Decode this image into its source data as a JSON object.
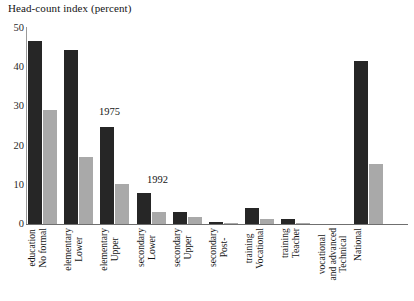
{
  "chart_data": {
    "type": "bar",
    "title": "Head-count index (percent)",
    "xlabel": "",
    "ylabel": "Head-count index (percent)",
    "ylim": [
      0,
      50
    ],
    "yticks": [
      0,
      10,
      20,
      30,
      40,
      50
    ],
    "grid": false,
    "legend_position": "inline-annotation",
    "annotations": [
      {
        "text": "1975",
        "series": "1975",
        "category": "Upper elementary"
      },
      {
        "text": "1992",
        "series": "1992",
        "category": "Upper elementary"
      }
    ],
    "categories": [
      "No formal education",
      "Lower elementary",
      "Upper elementary",
      "Lower secondary",
      "Upper secondary",
      "Post-secondary",
      "Vocational training",
      "Teacher training",
      "Technical and advanced vocational",
      "National"
    ],
    "category_lines": [
      [
        "No formal",
        "education"
      ],
      [
        "Lower",
        "elementary"
      ],
      [
        "Upper",
        "elementary"
      ],
      [
        "Lower",
        "secondary"
      ],
      [
        "Upper",
        "secondary"
      ],
      [
        "Post-",
        "secondary"
      ],
      [
        "Vocational",
        "training"
      ],
      [
        "Teacher",
        "training"
      ],
      [
        "Technical",
        "and advanced",
        "vocational"
      ],
      [
        "National"
      ]
    ],
    "series": [
      {
        "name": "1975",
        "color": "#262626",
        "values": [
          46.8,
          44.5,
          24.8,
          8.0,
          3.0,
          0.4,
          4.0,
          1.3,
          0.0,
          41.5
        ]
      },
      {
        "name": "1992",
        "color": "#a9a9a9",
        "values": [
          29.0,
          17.2,
          10.2,
          3.0,
          1.8,
          0.3,
          1.2,
          0.3,
          0.0,
          15.3
        ]
      }
    ]
  }
}
